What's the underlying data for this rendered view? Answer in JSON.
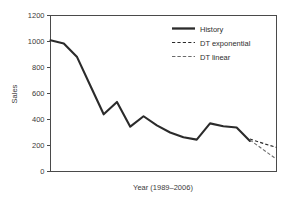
{
  "chart_data": {
    "type": "line",
    "title": "",
    "subtitle": "",
    "xlabel": "Year (1989–2006)",
    "ylabel": "Sales",
    "ylim": [
      0,
      1200
    ],
    "xlim": [
      1989,
      2006
    ],
    "grid": false,
    "legend_position": "top-right",
    "ytick_labels": [
      "0",
      "200",
      "400",
      "600",
      "800",
      "1000",
      "1200"
    ],
    "ytick_values": [
      0,
      200,
      400,
      600,
      800,
      1000,
      1200
    ],
    "xtick_labels": [],
    "x": [
      1989,
      1990,
      1991,
      1992,
      1993,
      1994,
      1995,
      1996,
      1997,
      1998,
      1999,
      2000,
      2001,
      2002,
      2003,
      2004
    ],
    "series": [
      {
        "name": "History",
        "style": "solid",
        "color": "#2b2b2b",
        "x": [
          1989,
          1990,
          1991,
          1992,
          1993,
          1994,
          1995,
          1996,
          1997,
          1998,
          1999,
          2000,
          2001,
          2002,
          2003,
          2004
        ],
        "values": [
          1010,
          985,
          880,
          660,
          440,
          535,
          345,
          425,
          355,
          300,
          263,
          245,
          370,
          348,
          338,
          235
        ]
      },
      {
        "name": "DT exponential",
        "style": "dashed",
        "color": "#2b2b2b",
        "x": [
          2004,
          2005,
          2006
        ],
        "values": [
          250,
          216,
          185
        ]
      },
      {
        "name": "DT linear",
        "style": "dashdot",
        "color": "#6a6a6a",
        "x": [
          2004,
          2005,
          2006
        ],
        "values": [
          243,
          168,
          95
        ]
      }
    ],
    "legend": [
      {
        "label": "History",
        "style": "solid"
      },
      {
        "label": "DT exponential",
        "style": "dashed"
      },
      {
        "label": "DT linear",
        "style": "dashdot"
      }
    ],
    "colors": {
      "axis": "#4a4a4a",
      "history": "#2b2b2b",
      "dt_exponential": "#2b2b2b",
      "dt_linear": "#6a6a6a",
      "background": "#ffffff"
    }
  }
}
